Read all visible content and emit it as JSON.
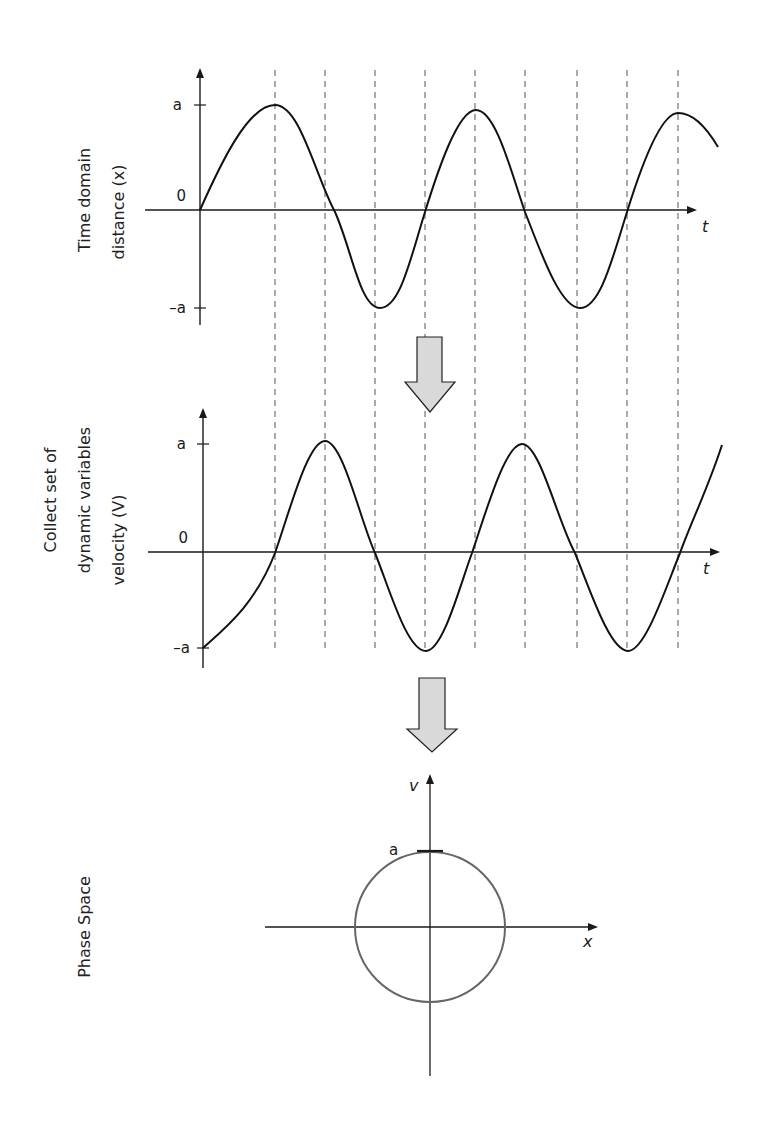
{
  "panels": {
    "time_domain": {
      "side_label_line1": "Time domain",
      "side_label_line2": "distance (x)",
      "y_tick_top": "a",
      "y_tick_zero": "0",
      "y_tick_bottom": "–a",
      "x_axis_label": "t"
    },
    "velocity": {
      "side_label_line1": "Collect set of",
      "side_label_line2": "dynamic variables",
      "side_label_line3": "velocity (V)",
      "y_tick_top": "a",
      "y_tick_zero": "0",
      "y_tick_bottom": "–a",
      "x_axis_label": "t"
    },
    "phase_space": {
      "side_label": "Phase Space",
      "v_axis_label": "v",
      "x_axis_label": "x",
      "radius_label": "a"
    }
  },
  "arrows": [
    {
      "name": "down-arrow-1",
      "icon": "block-arrow-down",
      "fill": "#d9d9d9"
    },
    {
      "name": "down-arrow-2",
      "icon": "block-arrow-down",
      "fill": "#d9d9d9"
    }
  ],
  "colors": {
    "curve": "#111111",
    "axis": "#1a1a1a",
    "dashed_guides": "#555555",
    "circle": "#666666",
    "arrow_fill": "#d9d9d9"
  }
}
